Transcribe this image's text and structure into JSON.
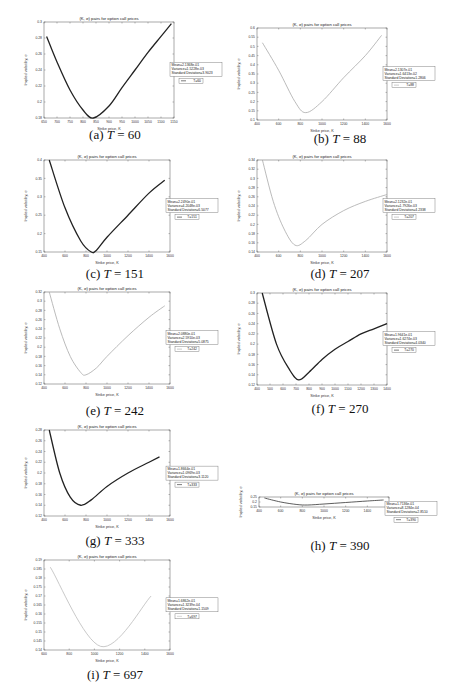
{
  "figure": {
    "panels": [
      {
        "id": "a",
        "caption_prefix": "(a)",
        "T_label": "T",
        "T_value": "= 60",
        "title": "(K, σ) pairs for option call prices",
        "xlabel": "Strike price, K",
        "ylabel": "Implied volatility, σ",
        "legend": {
          "mean": "Mean=2.1368e-01",
          "variance": "Variance=1.5228e-03",
          "std": "Standard Deviation=3.9023",
          "series": "T=60"
        }
      },
      {
        "id": "b",
        "caption_prefix": "(b)",
        "T_label": "T",
        "T_value": "= 88",
        "title": "(K, σ) pairs for option call prices",
        "xlabel": "Strike price, K",
        "ylabel": "Implied volatility, σ",
        "legend": {
          "mean": "Mean=2.1307e-01",
          "variance": "Variance=1.6413e-02",
          "std": "Standard Deviation=1.2806",
          "series": "T=88"
        }
      },
      {
        "id": "c",
        "caption_prefix": "(c)",
        "T_label": "T",
        "T_value": "= 151",
        "title": "(K, σ) pairs for option call prices",
        "xlabel": "Strike price, K",
        "ylabel": "Implied volatility, σ",
        "legend": {
          "mean": "Mean=2.2490e-01",
          "variance": "Variance=4.2048e-03",
          "std": "Standard Deviation=6.5077",
          "series": "T=151"
        }
      },
      {
        "id": "d",
        "caption_prefix": "(d)",
        "T_label": "T",
        "T_value": "= 207",
        "title": "(K, σ) pairs for option call prices",
        "xlabel": "Strike price, K",
        "ylabel": "Implied volatility, σ",
        "legend": {
          "mean": "Mean=2.1232e-01",
          "variance": "Variance=1.7926e-03",
          "std": "Standard Deviation=4.2338",
          "series": "T=207"
        }
      },
      {
        "id": "e",
        "caption_prefix": "(e)",
        "T_label": "T",
        "T_value": "= 242",
        "title": "(K, σ) pairs for option call prices",
        "xlabel": "Strike price, K",
        "ylabel": "Implied volatility, σ",
        "legend": {
          "mean": "Mean=2.0880e-01",
          "variance": "Variance=2.5910e-03",
          "std": "Standard Deviation=5.0875",
          "series": "T=242"
        }
      },
      {
        "id": "f",
        "caption_prefix": "(f)",
        "T_label": "T",
        "T_value": "= 270",
        "title": "(K, σ) pairs for option call prices",
        "xlabel": "Strike price, K",
        "ylabel": "Implied volatility, σ",
        "legend": {
          "mean": "Mean=1.9641e-01",
          "variance": "Variance=1.6274e-03",
          "std": "Standard Deviation=4.0340",
          "series": "T=270"
        }
      },
      {
        "id": "g",
        "caption_prefix": "(g)",
        "T_label": "T",
        "T_value": "= 333",
        "title": "(K, σ) pairs for option call prices",
        "xlabel": "Strike price, K",
        "ylabel": "Implied volatility, σ",
        "legend": {
          "mean": "Mean=1.8664e-01",
          "variance": "Variance=1.0969e-03",
          "std": "Standard Deviation=3.1120",
          "series": "T=333"
        }
      },
      {
        "id": "h",
        "caption_prefix": "(h)",
        "T_label": "T",
        "T_value": "= 390",
        "title": "(K, σ) pairs for option call prices",
        "xlabel": "Strike price, K",
        "ylabel": "Implied volatility, σ",
        "legend": {
          "mean": "Mean=1.7136e-01",
          "variance": "Variance=8.1284e-04",
          "std": "Standard Deviation=2.8510",
          "series": "T=390"
        }
      },
      {
        "id": "i",
        "caption_prefix": "(i)",
        "T_label": "T",
        "T_value": "= 697",
        "title": "(K, σ) pairs for option call prices",
        "xlabel": "Strike price, K",
        "ylabel": "Implied volatility, σ",
        "legend": {
          "mean": "Mean=1.6862e-01",
          "variance": "Variance=1.3239e-04",
          "std": "Standard Deviation=1.1509",
          "series": "T=697"
        }
      }
    ]
  },
  "chart_data": [
    {
      "type": "line",
      "panel": "a",
      "title": "(K, σ) pairs for option call prices",
      "xlabel": "Strike price, K",
      "ylabel": "Implied volatility, σ",
      "xlim": [
        650,
        1150
      ],
      "ylim": [
        0.18,
        0.3
      ],
      "xticks": [
        650,
        700,
        750,
        800,
        850,
        900,
        950,
        1000,
        1050,
        1100,
        1150
      ],
      "yticks": [
        0.18,
        0.2,
        0.22,
        0.24,
        0.26,
        0.28,
        0.3
      ],
      "series": [
        {
          "name": "T=60",
          "x": [
            660,
            700,
            750,
            800,
            840,
            900,
            950,
            1000,
            1050,
            1100,
            1140
          ],
          "y": [
            0.282,
            0.25,
            0.215,
            0.19,
            0.18,
            0.195,
            0.218,
            0.24,
            0.262,
            0.282,
            0.298
          ]
        }
      ],
      "color": "#222222"
    },
    {
      "type": "line",
      "panel": "b",
      "title": "(K, σ) pairs for option call prices",
      "xlabel": "Strike price, K",
      "ylabel": "Implied volatility, σ",
      "xlim": [
        400,
        1600
      ],
      "ylim": [
        0.1,
        0.6
      ],
      "xticks": [
        400,
        600,
        800,
        1000,
        1200,
        1400,
        1600
      ],
      "yticks": [
        0.1,
        0.15,
        0.2,
        0.25,
        0.3,
        0.35,
        0.4,
        0.45,
        0.5,
        0.55,
        0.6
      ],
      "series": [
        {
          "name": "T=88",
          "x": [
            450,
            600,
            750,
            850,
            1000,
            1200,
            1400,
            1550
          ],
          "y": [
            0.52,
            0.37,
            0.2,
            0.14,
            0.2,
            0.33,
            0.45,
            0.56
          ]
        }
      ],
      "color": "#aaaaaa"
    },
    {
      "type": "line",
      "panel": "c",
      "title": "(K, σ) pairs for option call prices",
      "xlabel": "Strike price, K",
      "ylabel": "Implied volatility, σ",
      "xlim": [
        400,
        1600
      ],
      "ylim": [
        0.15,
        0.4
      ],
      "xticks": [
        400,
        600,
        800,
        1000,
        1200,
        1400,
        1600
      ],
      "yticks": [
        0.15,
        0.2,
        0.25,
        0.3,
        0.35,
        0.4
      ],
      "series": [
        {
          "name": "T=151",
          "x": [
            450,
            600,
            750,
            850,
            900,
            1000,
            1200,
            1400,
            1550
          ],
          "y": [
            0.4,
            0.27,
            0.18,
            0.15,
            0.155,
            0.19,
            0.25,
            0.31,
            0.345
          ]
        }
      ],
      "color": "#222222"
    },
    {
      "type": "line",
      "panel": "d",
      "title": "(K, σ) pairs for option call prices",
      "xlabel": "Strike price, K",
      "ylabel": "Implied volatility, σ",
      "xlim": [
        400,
        1600
      ],
      "ylim": [
        0.14,
        0.34
      ],
      "xticks": [
        400,
        600,
        800,
        1000,
        1200,
        1400,
        1600
      ],
      "yticks": [
        0.14,
        0.16,
        0.18,
        0.2,
        0.22,
        0.24,
        0.26,
        0.28,
        0.3,
        0.32,
        0.34
      ],
      "series": [
        {
          "name": "T=207",
          "x": [
            450,
            550,
            650,
            750,
            850,
            1000,
            1200,
            1400,
            1600
          ],
          "y": [
            0.34,
            0.25,
            0.19,
            0.155,
            0.165,
            0.2,
            0.23,
            0.25,
            0.265
          ]
        }
      ],
      "color": "#aaaaaa"
    },
    {
      "type": "line",
      "panel": "e",
      "title": "(K, σ) pairs for option call prices",
      "xlabel": "Strike price, K",
      "ylabel": "Implied volatility, σ",
      "xlim": [
        400,
        1600
      ],
      "ylim": [
        0.12,
        0.32
      ],
      "xticks": [
        400,
        600,
        800,
        1000,
        1200,
        1400,
        1600
      ],
      "yticks": [
        0.12,
        0.14,
        0.16,
        0.18,
        0.2,
        0.22,
        0.24,
        0.26,
        0.28,
        0.3,
        0.32
      ],
      "series": [
        {
          "name": "T=242",
          "x": [
            450,
            550,
            650,
            750,
            800,
            900,
            1000,
            1200,
            1400,
            1550
          ],
          "y": [
            0.32,
            0.24,
            0.18,
            0.145,
            0.14,
            0.155,
            0.18,
            0.225,
            0.265,
            0.29
          ]
        }
      ],
      "color": "#aaaaaa"
    },
    {
      "type": "line",
      "panel": "f",
      "title": "(K, σ) pairs for option call prices",
      "xlabel": "Strike price, K",
      "ylabel": "Implied volatility, σ",
      "xlim": [
        400,
        1400
      ],
      "ylim": [
        0.12,
        0.3
      ],
      "xticks": [
        400,
        500,
        600,
        700,
        800,
        900,
        1000,
        1100,
        1200,
        1300,
        1400
      ],
      "yticks": [
        0.12,
        0.14,
        0.16,
        0.18,
        0.2,
        0.22,
        0.24,
        0.26,
        0.28,
        0.3
      ],
      "series": [
        {
          "name": "T=270",
          "x": [
            440,
            550,
            650,
            720,
            800,
            900,
            1000,
            1100,
            1200,
            1300,
            1400
          ],
          "y": [
            0.3,
            0.2,
            0.15,
            0.13,
            0.145,
            0.17,
            0.19,
            0.205,
            0.22,
            0.23,
            0.24
          ]
        }
      ],
      "color": "#222222"
    },
    {
      "type": "line",
      "panel": "g",
      "title": "(K, σ) pairs for option call prices",
      "xlabel": "Strike price, K",
      "ylabel": "Implied volatility, σ",
      "xlim": [
        400,
        1600
      ],
      "ylim": [
        0.12,
        0.28
      ],
      "xticks": [
        400,
        600,
        800,
        1000,
        1200,
        1400,
        1600
      ],
      "yticks": [
        0.12,
        0.14,
        0.16,
        0.18,
        0.2,
        0.22,
        0.24,
        0.26,
        0.28
      ],
      "series": [
        {
          "name": "T=333",
          "x": [
            450,
            550,
            650,
            750,
            850,
            1000,
            1200,
            1400,
            1500
          ],
          "y": [
            0.28,
            0.2,
            0.155,
            0.14,
            0.15,
            0.175,
            0.2,
            0.22,
            0.23
          ]
        }
      ],
      "color": "#222222"
    },
    {
      "type": "line",
      "panel": "h",
      "title": "(K, σ) pairs for option call prices",
      "xlabel": "Strike price, K",
      "ylabel": "Implied volatility, σ",
      "xlim": [
        400,
        1600
      ],
      "ylim": [
        0.15,
        0.25
      ],
      "xticks": [
        400,
        600,
        800,
        1000,
        1200,
        1400,
        1600
      ],
      "yticks": [
        0.15,
        0.2,
        0.25
      ],
      "series": [
        {
          "name": "T=390",
          "x": [
            450,
            600,
            750,
            850,
            1000,
            1200,
            1400,
            1550
          ],
          "y": [
            0.24,
            0.2,
            0.175,
            0.17,
            0.18,
            0.195,
            0.21,
            0.22
          ]
        }
      ],
      "color": "#333333"
    },
    {
      "type": "line",
      "panel": "i",
      "title": "(K, σ) pairs for option call prices",
      "xlabel": "Strike price, K",
      "ylabel": "Implied volatility, σ",
      "xlim": [
        600,
        1600
      ],
      "ylim": [
        0.14,
        0.19
      ],
      "xticks": [
        600,
        800,
        1000,
        1200,
        1400,
        1600
      ],
      "yticks": [
        0.14,
        0.145,
        0.15,
        0.155,
        0.16,
        0.165,
        0.17,
        0.175,
        0.18,
        0.185,
        0.19
      ],
      "series": [
        {
          "name": "T=697",
          "x": [
            650,
            1050,
            1450
          ],
          "y": [
            0.186,
            0.142,
            0.17
          ]
        }
      ],
      "color": "#bbbbbb"
    }
  ]
}
